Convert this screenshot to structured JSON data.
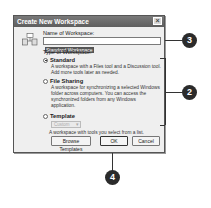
{
  "dialog": {
    "title": "Create New Workspace",
    "close_label": "×",
    "name_label": "Name of Workspace:",
    "name_value": "Standard Workspace",
    "type_label": "Type of Workspace:",
    "options": [
      {
        "label": "Standard",
        "selected": true,
        "description": "A workspace with a Files tool and a Discussion tool. Add more tools later as needed."
      },
      {
        "label": "File Sharing",
        "selected": false,
        "description": "A workspace for synchronizing a selected Windows folder across computers. You can access the synchronized folders from any Windows application."
      },
      {
        "label": "Template",
        "selected": false,
        "description": "A workspace with tools you select from a list."
      }
    ],
    "template_select_value": "Custom",
    "buttons": {
      "browse_templates": "Browse Templates",
      "ok": "OK",
      "cancel": "Cancel"
    }
  },
  "callouts": [
    {
      "number": "3",
      "target": "name-input"
    },
    {
      "number": "2",
      "target": "workspace-type-options"
    },
    {
      "number": "4",
      "target": "ok-button"
    }
  ]
}
